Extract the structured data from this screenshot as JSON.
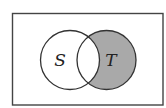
{
  "diagram": {
    "type": "venn",
    "universe": {
      "x": 12,
      "y": 13,
      "width": 151,
      "height": 92,
      "stroke": "#444444"
    },
    "sets": [
      {
        "name": "S",
        "label": "S",
        "cx": 70,
        "cy": 60,
        "r": 29.5,
        "label_x": 60,
        "label_y": 60
      },
      {
        "name": "T",
        "label": "T",
        "cx": 106.5,
        "cy": 60,
        "r": 29.5,
        "label_x": 111,
        "label_y": 60
      }
    ],
    "shaded_region": "T \\ S",
    "colors": {
      "shade": "#a9a9a9",
      "stroke": "#333333",
      "background": "#ffffff"
    }
  }
}
